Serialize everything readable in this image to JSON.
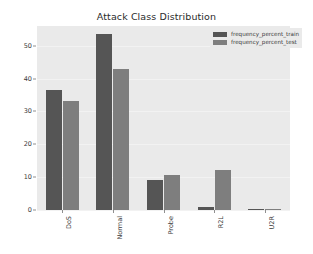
{
  "chart_data": {
    "type": "bar",
    "title": "Attack Class Distribution",
    "xlabel": "",
    "ylabel": "",
    "categories": [
      "DoS",
      "Normal",
      "Probe",
      "R2L",
      "U2R"
    ],
    "series": [
      {
        "name": "frequency_percent_train",
        "color": "#555555",
        "values": [
          36.5,
          53.5,
          9.2,
          0.8,
          0.04
        ]
      },
      {
        "name": "frequency_percent_test",
        "color": "#7e7e7e",
        "values": [
          33.1,
          43.0,
          10.7,
          12.2,
          0.2
        ]
      }
    ],
    "ylim": [
      0,
      56
    ],
    "yticks": [
      0,
      10,
      20,
      30,
      40,
      50
    ],
    "ytick_labels": [
      "0",
      "10",
      "20",
      "30",
      "40",
      "50"
    ],
    "grid": true,
    "legend_position": "upper right"
  },
  "legend": {
    "entries": [
      {
        "label": "frequency_percent_train",
        "color": "#555555"
      },
      {
        "label": "frequency_percent_test",
        "color": "#7e7e7e"
      }
    ]
  },
  "colors": {
    "figure_background": "#ffffff",
    "axes_background": "#eaeaea",
    "train_bar": "#555555",
    "test_bar": "#7e7e7e",
    "tick_text": "#3a3a3a",
    "title_text": "#2b2b2b"
  }
}
